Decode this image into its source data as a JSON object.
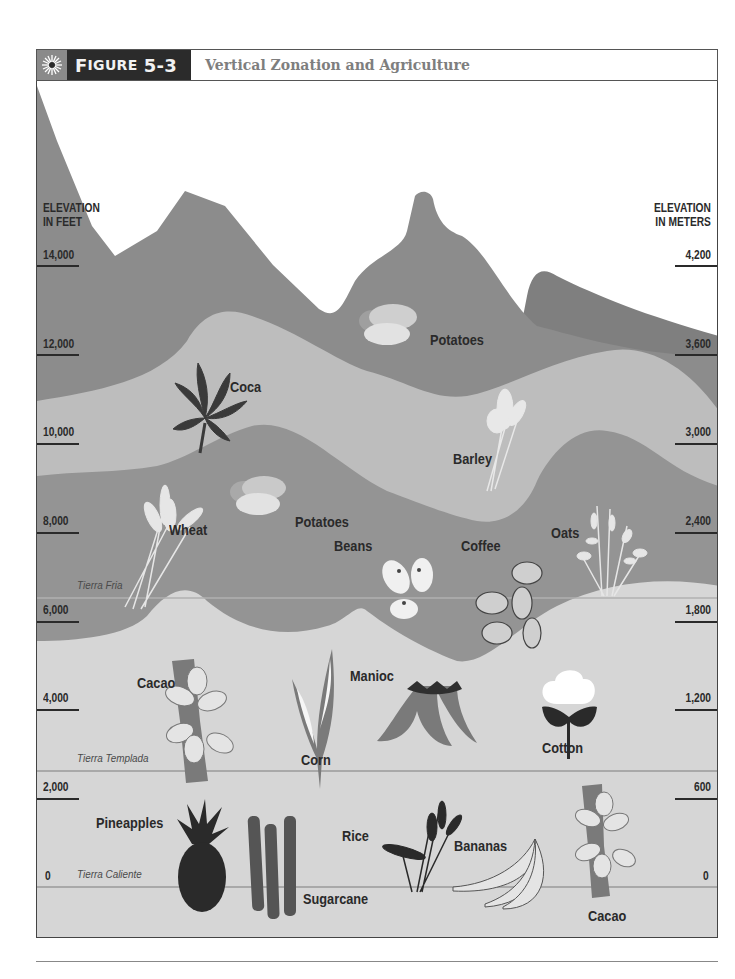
{
  "header": {
    "figure_label_first": "F",
    "figure_label_rest": "IGURE",
    "figure_number": "5-3",
    "title": "Vertical Zonation and Agriculture",
    "icon": "sun-burst-icon"
  },
  "axes": {
    "left": {
      "title_line1": "ELEVATION",
      "title_line2": "IN FEET",
      "ticks": [
        "14,000",
        "12,000",
        "10,000",
        "8,000",
        "6,000",
        "4,000",
        "2,000",
        "0"
      ]
    },
    "right": {
      "title_line1": "ELEVATION",
      "title_line2": "IN METERS",
      "ticks": [
        "4,200",
        "3,600",
        "3,000",
        "2,400",
        "1,800",
        "1,200",
        "600",
        "0"
      ]
    }
  },
  "zones": {
    "fria": "Tierra Fria",
    "templada": "Tierra Templada",
    "caliente": "Tierra Caliente"
  },
  "crops": {
    "potatoes_high": "Potatoes",
    "coca": "Coca",
    "barley": "Barley",
    "potatoes_mid": "Potatoes",
    "wheat": "Wheat",
    "oats": "Oats",
    "beans": "Beans",
    "coffee": "Coffee",
    "cacao_templada": "Cacao",
    "corn": "Corn",
    "manioc": "Manioc",
    "cotton": "Cotton",
    "pineapples": "Pineapples",
    "sugarcane": "Sugarcane",
    "rice": "Rice",
    "bananas": "Bananas",
    "cacao_caliente": "Cacao"
  },
  "colors": {
    "header_dark": "#2b2b2b",
    "header_icon_bg": "#8a8a8a",
    "mountain_dark": "#8c8c8c",
    "mountain_peak_far": "#7f7f7f",
    "band_light": "#bdbdbd",
    "band_mid": "#949494",
    "lowland": "#d6d6d6",
    "text": "#2a2a2a"
  }
}
